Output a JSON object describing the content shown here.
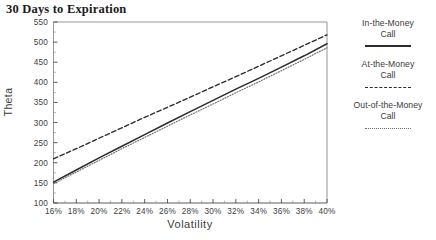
{
  "chart_data": {
    "type": "line",
    "title": "30 Days to Expiration",
    "xlabel": "Volatility",
    "ylabel": "Theta",
    "grid": false,
    "legend_position": "right",
    "xlim": [
      16,
      40
    ],
    "ylim": [
      100,
      550
    ],
    "x_tick_labels": [
      "16%",
      "18%",
      "20%",
      "22%",
      "24%",
      "26%",
      "28%",
      "30%",
      "32%",
      "34%",
      "36%",
      "38%",
      "40%"
    ],
    "x": [
      16,
      18,
      20,
      22,
      24,
      26,
      28,
      30,
      32,
      34,
      36,
      38,
      40
    ],
    "y_tick_labels": [
      "100",
      "150",
      "200",
      "250",
      "300",
      "350",
      "400",
      "450",
      "500",
      "550"
    ],
    "y_ticks": [
      100,
      150,
      200,
      250,
      300,
      350,
      400,
      450,
      500,
      550
    ],
    "series": [
      {
        "name": "In-the-Money Call",
        "style": "solid",
        "color": "#2b2b2b",
        "values": [
          152,
          182,
          212,
          241,
          270,
          299,
          327,
          355,
          383,
          410,
          438,
          466,
          496
        ]
      },
      {
        "name": "At-the-Money Call",
        "style": "dashed",
        "color": "#2b2b2b",
        "values": [
          210,
          235,
          261,
          287,
          313,
          338,
          363,
          389,
          414,
          440,
          466,
          492,
          518
        ]
      },
      {
        "name": "Out-of-the-Money Call",
        "style": "dotted",
        "color": "#6b6b6b",
        "values": [
          148,
          177,
          206,
          235,
          263,
          291,
          319,
          346,
          374,
          401,
          429,
          457,
          486
        ]
      }
    ]
  },
  "legend": {
    "entries": [
      {
        "label_line1": "In-the-Money",
        "label_line2": "Call",
        "style": "solid"
      },
      {
        "label_line1": "At-the-Money",
        "label_line2": "Call",
        "style": "dashed"
      },
      {
        "label_line1": "Out-of-the-Money",
        "label_line2": "Call",
        "style": "dotted"
      }
    ]
  }
}
